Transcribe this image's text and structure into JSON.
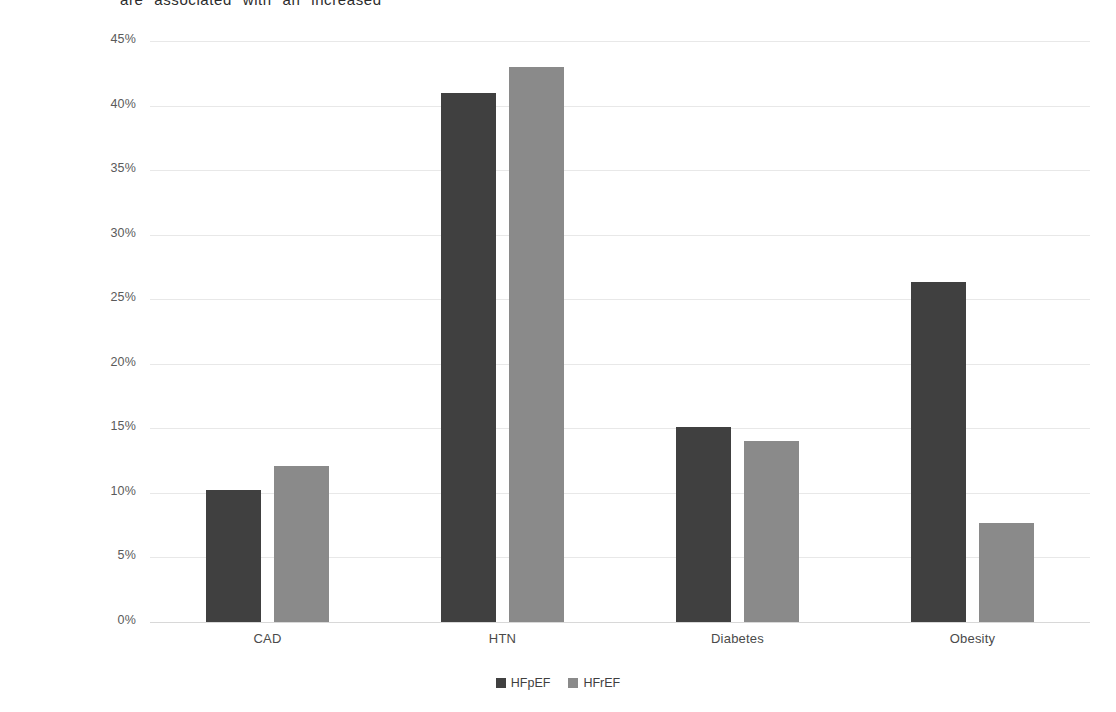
{
  "document": {
    "truncated_top_line": "are  associated  with  an  increased"
  },
  "chart_data": {
    "type": "bar",
    "title": "",
    "xlabel": "",
    "ylabel": "Population Attributable Risk",
    "categories": [
      "CAD",
      "HTN",
      "Diabetes",
      "Obesity"
    ],
    "series": [
      {
        "name": "HFpEF",
        "color": "#404040",
        "values": [
          10.2,
          41.0,
          15.1,
          26.3
        ]
      },
      {
        "name": "HFrEF",
        "color": "#8a8a8a",
        "values": [
          12.1,
          43.0,
          14.0,
          7.7
        ]
      }
    ],
    "ylim": [
      0,
      45
    ],
    "ytick_values": [
      0,
      5,
      10,
      15,
      20,
      25,
      30,
      35,
      40,
      45
    ],
    "ytick_labels": [
      "0%",
      "5%",
      "10%",
      "15%",
      "20%",
      "25%",
      "30%",
      "35%",
      "40%",
      "45%"
    ],
    "grid": true,
    "legend_position": "bottom",
    "value_format": "percent"
  },
  "legend": {
    "items": [
      {
        "label": "HFpEF",
        "color": "#404040"
      },
      {
        "label": "HFrEF",
        "color": "#8a8a8a"
      }
    ]
  },
  "colors": {
    "background": "#ffffff",
    "gridline": "#e8e8e8",
    "axis_text": "#5a5a5a",
    "series_1": "#404040",
    "series_2": "#8a8a8a"
  }
}
